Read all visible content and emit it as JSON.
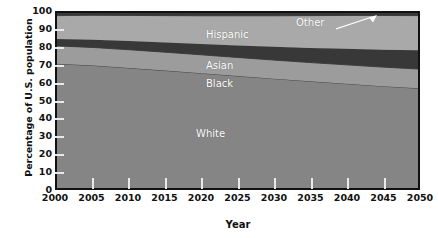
{
  "chart_data": {
    "type": "area",
    "title": "",
    "xlabel": "Year",
    "ylabel": "Percentage of U.S. population",
    "xlim": [
      2000,
      2050
    ],
    "ylim": [
      0,
      100
    ],
    "grid": false,
    "stacked": true,
    "legend_position": "inline-labels",
    "x": [
      2000,
      2005,
      2010,
      2015,
      2020,
      2025,
      2030,
      2035,
      2040,
      2045,
      2050
    ],
    "xticks": [
      "2000",
      "2005",
      "2010",
      "2015",
      "2020",
      "2025",
      "2030",
      "2035",
      "2040",
      "2045",
      "2050"
    ],
    "yticks": [
      "0",
      "10",
      "20",
      "30",
      "40",
      "50",
      "60",
      "70",
      "80",
      "90",
      "100"
    ],
    "series": [
      {
        "name": "White",
        "color": "#858585",
        "values": [
          71.0,
          70.0,
          68.6,
          67.1,
          65.6,
          64.0,
          62.5,
          61.0,
          59.6,
          58.2,
          57.0
        ]
      },
      {
        "name": "Black",
        "color": "#9c9c9c",
        "values": [
          10.2,
          10.3,
          10.4,
          10.5,
          10.5,
          10.6,
          10.6,
          10.7,
          10.8,
          10.9,
          11.0
        ]
      },
      {
        "name": "Asian",
        "color": "#383838",
        "values": [
          3.9,
          4.4,
          5.0,
          5.6,
          6.2,
          6.9,
          7.6,
          8.3,
          9.1,
          9.9,
          10.7
        ]
      },
      {
        "name": "Hispanic",
        "color": "#a9a9a9",
        "values": [
          13.4,
          14.0,
          14.6,
          15.3,
          16.1,
          16.9,
          17.7,
          18.5,
          19.1,
          19.6,
          19.8
        ]
      },
      {
        "name": "Other",
        "color": "#383838",
        "values": [
          1.5,
          1.3,
          1.4,
          1.5,
          1.6,
          1.6,
          1.6,
          1.5,
          1.4,
          1.4,
          1.5
        ]
      }
    ],
    "cumulative_upper_boundaries": {
      "white_top": [
        71.0,
        70.0,
        68.6,
        67.1,
        65.6,
        64.0,
        62.5,
        61.0,
        59.6,
        58.2,
        57.0
      ],
      "black_top": [
        81.2,
        80.3,
        79.0,
        77.6,
        76.1,
        74.6,
        73.1,
        71.7,
        70.4,
        69.1,
        68.0
      ],
      "asian_top": [
        85.1,
        84.7,
        84.0,
        83.2,
        82.3,
        81.5,
        80.7,
        80.0,
        79.5,
        79.0,
        78.7
      ],
      "hispanic_top": [
        98.5,
        98.7,
        98.6,
        98.5,
        98.4,
        98.4,
        98.4,
        98.5,
        98.6,
        98.6,
        98.5
      ],
      "other_top": [
        100,
        100,
        100,
        100,
        100,
        100,
        100,
        100,
        100,
        100,
        100
      ]
    },
    "annotations": [
      {
        "name": "other-callout",
        "text": "Other",
        "points_to": "other-band"
      }
    ]
  },
  "labels": {
    "hispanic": "Hispanic",
    "asian": "Asian",
    "black": "Black",
    "white": "White",
    "other": "Other"
  },
  "axes": {
    "x_title": "Year",
    "y_title": "Percentage of U.S. population"
  },
  "colors": {
    "white_band": "#858585",
    "black_band": "#9c9c9c",
    "asian_band": "#383838",
    "hispanic_band": "#a9a9a9",
    "other_band": "#383838",
    "frame": "#111111",
    "tick": "#e9e9e9",
    "label_text": "#ffffff",
    "axis_text": "#111111"
  }
}
